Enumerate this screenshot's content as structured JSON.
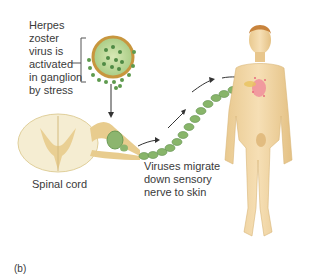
{
  "labels": {
    "virus_activation": [
      "Herpes",
      "zoster",
      "virus is",
      "activated",
      "in ganglion",
      "by stress"
    ],
    "spinal_cord": "Spinal cord",
    "migration": [
      "Viruses migrate",
      "down sensory",
      "nerve to skin"
    ],
    "panel": "(b)"
  },
  "colors": {
    "background": "#ffffff",
    "virus_green": "#6aa35a",
    "capsule_ring": "#c8963e",
    "nerve_yellow": "#e6cf8f",
    "skin": "#f1d6a6",
    "rash": "#f08a9a",
    "text": "#3a3a3a"
  }
}
